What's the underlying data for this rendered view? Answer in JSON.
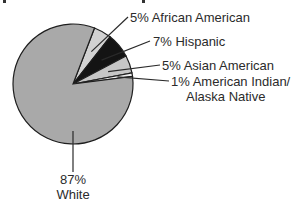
{
  "chart_data": {
    "type": "pie",
    "title": "",
    "categories": [
      "African American",
      "Hispanic",
      "Asian American",
      "American Indian/Alaska Native",
      "White"
    ],
    "values": [
      5,
      7,
      5,
      1,
      87
    ],
    "units": "%",
    "labels": [
      {
        "text": "5% African American"
      },
      {
        "text": "7% Hispanic"
      },
      {
        "text": "5% Asian American"
      },
      {
        "text": "1% American Indian/",
        "text2": "Alaska Native"
      },
      {
        "text": "87%",
        "text2": "White"
      }
    ],
    "colors": [
      "#d2d2d2",
      "#141414",
      "#c6c6c6",
      "#efefef",
      "#a9a9a9"
    ],
    "start_angle_deg": 21,
    "legend": "none (direct labels with leader lines)",
    "grid": false
  }
}
